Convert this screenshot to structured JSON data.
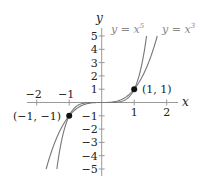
{
  "chart_data": {
    "type": "line",
    "title": "",
    "xlabel": "x",
    "ylabel": "y",
    "xlim": [
      -2.3,
      2.3
    ],
    "ylim": [
      -5.3,
      5.3
    ],
    "grid": false,
    "x_ticks": [
      -2,
      -1,
      1,
      2
    ],
    "x_tick_labels": [
      "−2",
      "−1",
      "1",
      "2"
    ],
    "y_ticks": [
      5,
      4,
      3,
      2,
      1,
      -1,
      -2,
      -3,
      -4,
      -5
    ],
    "y_tick_labels": [
      "5",
      "4",
      "3",
      "2",
      "1",
      "−1",
      "−2",
      "−3",
      "−4",
      "−5"
    ],
    "series": [
      {
        "name": "y = x^5",
        "label": "y = x",
        "exponent_label": "5",
        "exponent": 5,
        "color": "#777777",
        "x": [
          -1.38,
          -1.2,
          -1.0,
          -0.8,
          -0.5,
          0,
          0.5,
          0.8,
          1.0,
          1.2,
          1.38
        ],
        "y": [
          -5.0,
          -2.49,
          -1.0,
          -0.33,
          -0.03,
          0,
          0.03,
          0.33,
          1.0,
          2.49,
          5.0
        ]
      },
      {
        "name": "y = x^3",
        "label": "y = x",
        "exponent_label": "3",
        "exponent": 3,
        "color": "#777777",
        "x": [
          -1.71,
          -1.5,
          -1.0,
          -0.5,
          0,
          0.5,
          1.0,
          1.5,
          1.71
        ],
        "y": [
          -5.0,
          -3.38,
          -1.0,
          -0.13,
          0,
          0.13,
          1.0,
          3.38,
          5.0
        ]
      }
    ],
    "annotations": [
      {
        "text": "(1, 1)",
        "x": 1,
        "y": 1,
        "marker": "filled-circle"
      },
      {
        "text": "(−1, −1)",
        "x": -1,
        "y": -1,
        "marker": "filled-circle"
      }
    ]
  },
  "labels": {
    "x_axis": "x",
    "y_axis": "y",
    "curve5_base": "y = x",
    "curve5_exp": "5",
    "curve3_base": "y = x",
    "curve3_exp": "3",
    "point_pos": "(1, 1)",
    "point_neg": "(−1, −1)"
  }
}
